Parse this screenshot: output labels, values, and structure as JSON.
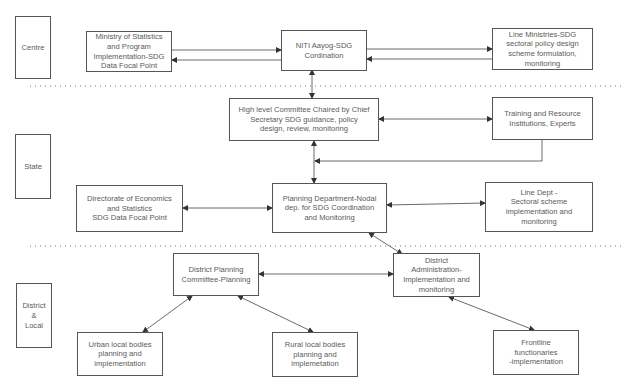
{
  "levels": {
    "centre": "Centre",
    "state": "State",
    "district": "District\n&\nLocal"
  },
  "nodes": {
    "mospi": "Ministry of Statistics\nand Program\nImplementation-SDG\nData Focal Point",
    "niti": "NITI Aayog-SDG\nCordination",
    "line_ministries": "Line Ministries-SDG\nsectoral policy design\nscheme formulation,\nmonitoring",
    "high_level_committee": "High level Committee Chaired by Chief\nSecretary SDG guidance, policy\ndesign, review, monitoring",
    "training": "Training and Resource\nInstitutions, Experts",
    "directorate": "Directorate of Economics\nand Statistics\nSDG Data Focal Point",
    "planning_dept": "Planning Department-Nodal\ndep. for SDG Coordination\nand Monitoring",
    "line_dept": "Line Dept -\nSectoral scheme\nimplementation and\nmonitoring",
    "district_planning": "District Planning\nCommittee-Planning",
    "district_admin": "District\nAdministration-\nImplementation and\nmonitoring",
    "urban": "Urban local bodies\nplanning and\nimplementation",
    "rural": "Rural local bodies\nplanning and\nimplemetation",
    "frontline": "Frontline\nfunctionaries\n-implementation"
  },
  "colors": {
    "stroke": "#444444",
    "text": "#5a5a5a",
    "divider": "#777777"
  }
}
